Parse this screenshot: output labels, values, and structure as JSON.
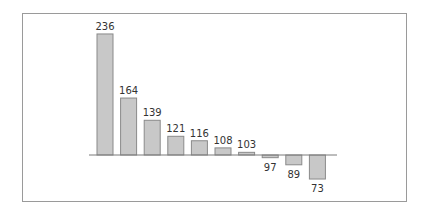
{
  "chart_data": {
    "type": "bar",
    "title": "",
    "xlabel": "",
    "ylabel": "",
    "baseline": 100,
    "categories": [
      "1",
      "2",
      "3",
      "4",
      "5",
      "6",
      "7",
      "8",
      "9",
      "10"
    ],
    "values": [
      236,
      164,
      139,
      121,
      116,
      108,
      103,
      97,
      89,
      73
    ],
    "data_labels": [
      "236",
      "164",
      "139",
      "121",
      "116",
      "108",
      "103",
      "97",
      "89",
      "73"
    ],
    "grid": false,
    "legend": null,
    "colors": {
      "bar_fill": "#c8c8c8",
      "bar_stroke": "#8a8a8a",
      "baseline": "#7a7a7a",
      "frame": "#9a9a9a",
      "label": "#333333"
    }
  }
}
